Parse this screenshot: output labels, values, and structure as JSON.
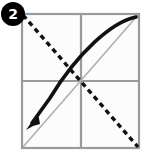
{
  "figure": {
    "step_badge": {
      "label": "2",
      "shape": "circle",
      "fill_color": "#000000",
      "text_color": "#ffffff"
    },
    "paper": {
      "shape": "square",
      "border_color": "#9a9a9a",
      "fill_color": "#fcfcfc",
      "left": 22,
      "top": 14,
      "right": 139,
      "bottom": 148
    },
    "guides": {
      "crease_color": "#9a9a9a",
      "horizontal_midline": {
        "y": 81,
        "x1": 22,
        "x2": 139
      },
      "vertical_midline": {
        "x": 81,
        "y1": 14,
        "y2": 148
      },
      "anti_diagonal": {
        "x1": 22,
        "y1": 148,
        "x2": 139,
        "y2": 14,
        "color": "#b0b0b0"
      }
    },
    "fold_line": {
      "name": "valley-fold-dashed-diagonal",
      "style": "dashed",
      "color": "#111111",
      "width": 3.4,
      "dash": "5 4",
      "x1": 22,
      "y1": 14,
      "x2": 139,
      "y2": 148
    },
    "motion_arrow": {
      "name": "fold-motion-arrow",
      "color": "#111111",
      "width": 3.6,
      "path": "M 136 17 C 108 24 74 56 44 106 L 29 126",
      "arrowhead": {
        "x": 26,
        "y": 129,
        "direction": "down-left"
      }
    }
  }
}
